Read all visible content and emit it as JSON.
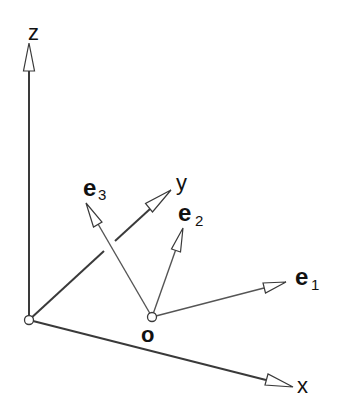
{
  "diagram": {
    "title": "",
    "colors": {
      "axis": "#3a3a3a",
      "vector": "#555555",
      "text": "#111111",
      "background": "#ffffff"
    },
    "origin_O": {
      "x": 29,
      "y": 320
    },
    "origin_o": {
      "x": 152,
      "y": 317,
      "label": "o"
    },
    "axes": [
      {
        "id": "z",
        "label": "z",
        "from": [
          29,
          320
        ],
        "to": [
          29,
          43
        ]
      },
      {
        "id": "y",
        "label": "y",
        "from": [
          29,
          320
        ],
        "to": [
          171,
          190
        ]
      },
      {
        "id": "x",
        "label": "x",
        "from": [
          29,
          320
        ],
        "to": [
          293,
          387
        ]
      }
    ],
    "vectors": [
      {
        "id": "e1",
        "label_main": "e",
        "label_sub": "1",
        "from": [
          152,
          317
        ],
        "to": [
          286,
          282
        ]
      },
      {
        "id": "e2",
        "label_main": "e",
        "label_sub": "2",
        "from": [
          152,
          317
        ],
        "to": [
          183,
          228
        ]
      },
      {
        "id": "e3",
        "label_main": "e",
        "label_sub": "3",
        "from": [
          152,
          317
        ],
        "to": [
          86,
          203
        ]
      }
    ],
    "labels": {
      "z": "z",
      "y": "y",
      "x": "x",
      "o": "o",
      "e1_main": "e",
      "e1_sub": "1",
      "e2_main": "e",
      "e2_sub": "2",
      "e3_main": "e",
      "e3_sub": "3"
    }
  }
}
